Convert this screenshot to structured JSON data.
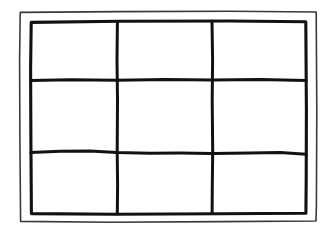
{
  "figure": {
    "medium": "ink line drawing on white paper",
    "background_color": "#ffffff",
    "canvas": {
      "width": 335,
      "height": 235
    }
  },
  "strokes": {
    "outer_frame": {
      "name": "outer-border-rectangle",
      "color": "#3a3a3a",
      "width_px": 1.6,
      "bounds": {
        "x": 19,
        "y": 11,
        "w": 298,
        "h": 211
      }
    },
    "inner_frame": {
      "name": "inner-grid-border-rectangle",
      "color": "#111111",
      "width_px": 3.1,
      "bounds": {
        "x": 30,
        "y": 21,
        "w": 277,
        "h": 193
      }
    },
    "vertical_dividers": {
      "color": "#111111",
      "width_px": 3.0,
      "x_positions": [
        117,
        212
      ]
    },
    "horizontal_dividers": {
      "color": "#111111",
      "width_px": 3.0,
      "y_positions": [
        80,
        153
      ]
    }
  },
  "grid": {
    "rows": 3,
    "columns": 3,
    "cell_count": 9,
    "column_edges": [
      30,
      117,
      212,
      307
    ],
    "row_edges": [
      21,
      80,
      153,
      214
    ],
    "cells": [
      {
        "id": "r1c1",
        "row": 1,
        "column": 1,
        "label": ""
      },
      {
        "id": "r1c2",
        "row": 1,
        "column": 2,
        "label": ""
      },
      {
        "id": "r1c3",
        "row": 1,
        "column": 3,
        "label": ""
      },
      {
        "id": "r2c1",
        "row": 2,
        "column": 1,
        "label": ""
      },
      {
        "id": "r2c2",
        "row": 2,
        "column": 2,
        "label": ""
      },
      {
        "id": "r2c3",
        "row": 2,
        "column": 3,
        "label": ""
      },
      {
        "id": "r3c1",
        "row": 3,
        "column": 1,
        "label": ""
      },
      {
        "id": "r3c2",
        "row": 3,
        "column": 2,
        "label": ""
      },
      {
        "id": "r3c3",
        "row": 3,
        "column": 3,
        "label": ""
      }
    ]
  },
  "paths": {
    "outer_frame_d": "M 20.2 12.4 L 120 11.6 L 230 11.2 L 316.2 12.0 L 316.8 110 L 316.4 205 L 316.0 221.0 L 220 221.6 L 110 222.2 L 20.6 221.4 L 19.9 140 L 19.6 60 Z",
    "inner_frame_d": "M 31.2 22.4 L 120 21.3 L 230 21.0 L 305.8 21.8 L 306.4 110 L 306.2 180 L 305.9 213.2 L 220 213.8 L 115 214.2 L 31.4 213.6 L 30.9 140 L 30.6 70 Z",
    "vertical_1_d": "M 117.4 21.5 L 117.0 60 L 117.5 100 L 117.2 152 L 117.6 185 L 117.3 213.8",
    "vertical_2_d": "M 212.0 21.2 L 212.6 60 L 212.2 100 L 212.7 152 L 212.3 185 L 212.1 213.6",
    "horizontal_1_d": "M 30.8 80.6 L 70 79.8 L 117 80.2 L 165 79.6 L 212 80.1 L 260 79.5 L 306.2 80.4",
    "horizontal_2_d": "M 30.8 152.4 L 60 151.2 L 90 151.0 L 117 152.6 L 150 153.2 L 180 153.0 L 212 153.4 L 250 153.0 L 280 152.6 L 306.2 154.2"
  }
}
